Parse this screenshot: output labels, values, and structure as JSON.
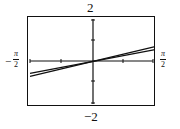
{
  "chart_data": {
    "type": "line",
    "title": "",
    "xlabel": "",
    "ylabel": "",
    "xlim": [
      "-π/2",
      "π/2"
    ],
    "xlim_numeric": [
      -1.5708,
      1.5708
    ],
    "ylim": [
      -2,
      2
    ],
    "x_ticks": 4,
    "y_ticks": 4,
    "grid": false,
    "legend": null,
    "note": "Two nearly coincident increasing curves through the origin; exact equations not labeled. Endpoint values are approximate readings.",
    "series": [
      {
        "name": "curve-1 (upper at right)",
        "x": [
          -1.5708,
          0,
          1.5708
        ],
        "y": [
          -0.67,
          0,
          0.67
        ]
      },
      {
        "name": "curve-2 (lower at right)",
        "x": [
          -1.5708,
          0,
          1.5708
        ],
        "y": [
          -0.53,
          0,
          0.53
        ]
      }
    ],
    "labels": {
      "y_top": "2",
      "y_bottom": "−2",
      "x_left_num": "π",
      "x_left_den": "2",
      "x_left_sign": "−",
      "x_right_num": "π",
      "x_right_den": "2"
    }
  }
}
